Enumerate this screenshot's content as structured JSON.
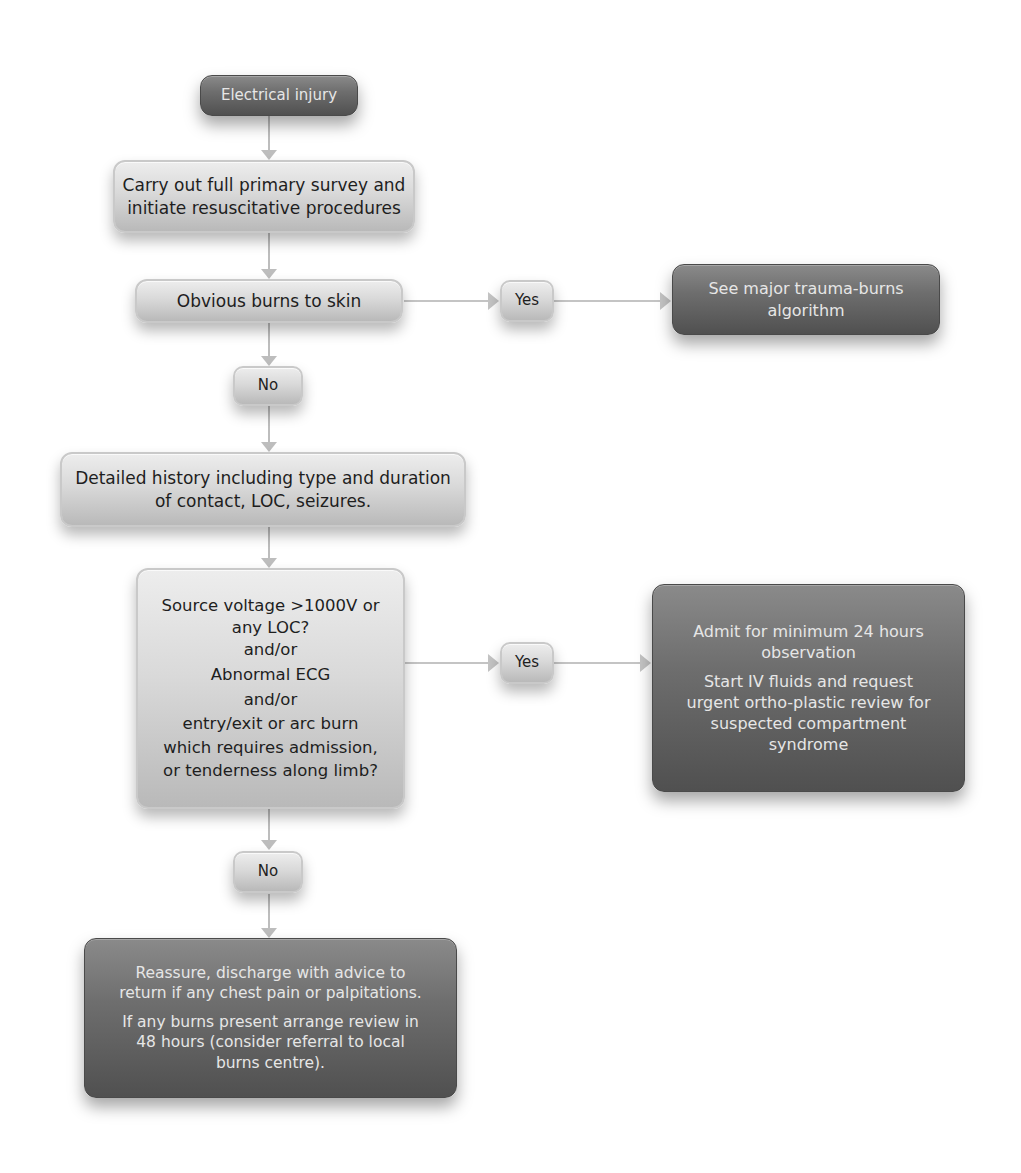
{
  "diagram": {
    "type": "flowchart",
    "title": "Electrical injury",
    "nodes": {
      "start": {
        "text": "Electrical injury",
        "style": "dark"
      },
      "primary_survey": {
        "lines": [
          "Carry out full primary survey and",
          "initiate resuscitative procedures"
        ],
        "style": "light"
      },
      "burns_question": {
        "text": "Obvious burns to skin",
        "style": "light"
      },
      "burns_yes": {
        "text": "Yes",
        "style": "light"
      },
      "burns_yes_action": {
        "lines": [
          "See major trauma-burns",
          "algorithm"
        ],
        "style": "dark"
      },
      "burns_no": {
        "text": "No",
        "style": "light"
      },
      "history": {
        "lines": [
          "Detailed history including type and duration",
          "of contact, LOC, seizures."
        ],
        "style": "light"
      },
      "risk_question": {
        "lines": [
          "Source voltage >1000V or",
          "any LOC?",
          "and/or",
          "Abnormal ECG",
          "and/or",
          "entry/exit or arc burn",
          "which requires admission,",
          "or tenderness along limb?"
        ],
        "style": "light"
      },
      "risk_yes": {
        "text": "Yes",
        "style": "light"
      },
      "admit": {
        "para1": [
          "Admit for minimum 24 hours",
          "observation"
        ],
        "para2": [
          "Start IV fluids and request",
          "urgent ortho-plastic review for",
          "suspected compartment",
          "syndrome"
        ],
        "style": "dark"
      },
      "risk_no": {
        "text": "No",
        "style": "light"
      },
      "discharge": {
        "para1": [
          "Reassure, discharge with advice to",
          "return if any chest pain or palpitations."
        ],
        "para2": [
          "If any burns present arrange review in",
          "48 hours (consider referral to local",
          "burns centre)."
        ],
        "style": "dark"
      }
    },
    "edges": [
      {
        "from": "start",
        "to": "primary_survey"
      },
      {
        "from": "primary_survey",
        "to": "burns_question"
      },
      {
        "from": "burns_question",
        "to": "burns_yes"
      },
      {
        "from": "burns_yes",
        "to": "burns_yes_action"
      },
      {
        "from": "burns_question",
        "to": "burns_no"
      },
      {
        "from": "burns_no",
        "to": "history"
      },
      {
        "from": "history",
        "to": "risk_question"
      },
      {
        "from": "risk_question",
        "to": "risk_yes"
      },
      {
        "from": "risk_yes",
        "to": "admit"
      },
      {
        "from": "risk_question",
        "to": "risk_no"
      },
      {
        "from": "risk_no",
        "to": "discharge"
      }
    ],
    "colors": {
      "light_box": "#d9d9d9",
      "dark_box": "#6e6e6e",
      "connector": "#bdbdbd",
      "light_text": "#1e1e1e",
      "dark_text": "#e6e6e6"
    }
  }
}
